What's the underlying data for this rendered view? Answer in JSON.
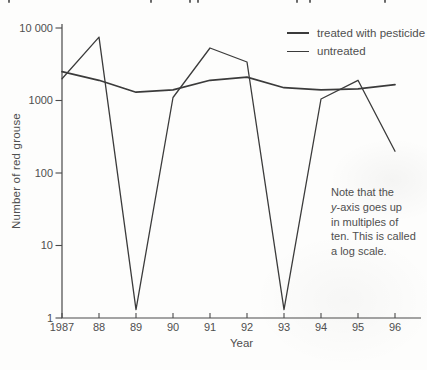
{
  "figure": {
    "cropped_top_marks_x": [
      8,
      150,
      189,
      197,
      296,
      309,
      384
    ]
  },
  "chart_data": {
    "type": "line",
    "x": [
      1987,
      1988,
      1989,
      1990,
      1991,
      1992,
      1993,
      1994,
      1995,
      1996
    ],
    "x_tick_labels": [
      "1987",
      "88",
      "89",
      "90",
      "91",
      "92",
      "93",
      "94",
      "95",
      "96"
    ],
    "series": [
      {
        "name": "treated with pesticide",
        "values": [
          2500,
          1900,
          1300,
          1400,
          1900,
          2100,
          1500,
          1400,
          1450,
          1650
        ],
        "color": "#3b3b3b",
        "width": 1.7
      },
      {
        "name": "untreated",
        "values": [
          2000,
          7500,
          1.3,
          1100,
          5300,
          3400,
          1.3,
          1050,
          1900,
          200
        ],
        "color": "#3b3b3b",
        "width": 1.3
      }
    ],
    "xlabel": "Year",
    "ylabel": "Number of red grouse",
    "yscale": "log",
    "ylim": [
      1,
      10000
    ],
    "y_ticks": [
      1,
      10,
      100,
      1000,
      10000
    ],
    "y_tick_labels": [
      "1",
      "10",
      "100",
      "1000",
      "10 000"
    ],
    "grid": false,
    "legend_position": "top-right"
  },
  "annotation": {
    "lines": [
      "Note that the",
      "y-axis goes up",
      "in multiples of",
      "ten. This is called",
      "a log scale."
    ]
  },
  "colors": {
    "line": "#3b3b3b",
    "axis": "#4a4a4a",
    "text": "#4f4f4f"
  }
}
